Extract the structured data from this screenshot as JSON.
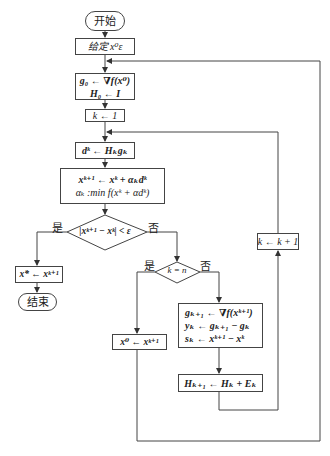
{
  "flowchart": {
    "start": "开始",
    "init": "给定 x⁰ε",
    "gradient_init": [
      "g₀ ← ∇f(x⁰)",
      "H₀ ← I"
    ],
    "k_init": "k ← 1",
    "direction": "dᵏ ← Hₖgₖ",
    "update": [
      "xᵏ⁺¹ ← xᵏ + αₖdᵏ",
      "αₖ :min f(xᵏ + αdᵏ)"
    ],
    "convergence_test": "|xᵏ⁺¹ − xᵏ| < ε",
    "yes_label": "是",
    "no_label": "否",
    "result": "x* ← xᵏ⁺¹",
    "end": "结束",
    "k_equals_n": "k = n",
    "restart": "x⁰ ← xᵏ⁺¹",
    "quasi_newton": [
      "gₖ₊₁ ← ∇f(xᵏ⁺¹)",
      "yₖ ← gₖ₊₁ − gₖ",
      "sₖ ← xᵏ⁺¹ − xᵏ"
    ],
    "hessian_update": "Hₖ₊₁ ← Hₖ + Eₖ",
    "increment": "k ← k + 1"
  }
}
